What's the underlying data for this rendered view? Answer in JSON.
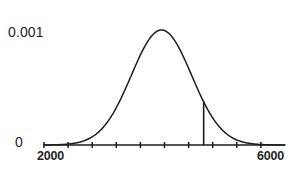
{
  "figure": {
    "title": "",
    "background_color": "#ffffff",
    "ink_color": "#1c1c1c",
    "label_color": "#242424"
  },
  "axes": {
    "y_axis": {
      "labels": [
        {
          "text": "0.001",
          "value": 0.001,
          "position": "top"
        },
        {
          "text": "0",
          "value": 0,
          "position": "bottom"
        }
      ],
      "line_drawn": false,
      "range": [
        0,
        0.001
      ]
    },
    "x_axis": {
      "labels": [
        {
          "text": "2000",
          "value": 2000,
          "position": "left"
        },
        {
          "text": "6000",
          "value": 6000,
          "position": "right"
        }
      ],
      "line_drawn": true,
      "range": [
        2000,
        6000
      ],
      "tick_count": 10,
      "tick_values": [
        2000,
        2400,
        2800,
        3200,
        3600,
        4000,
        4400,
        4800,
        5200,
        5600
      ]
    }
  },
  "annotations": {
    "vertical_marker": {
      "x_value": 4650,
      "description": "vertical line from axis up to the curve"
    }
  },
  "chart_data": {
    "type": "line",
    "title": "",
    "xlabel": "",
    "ylabel": "",
    "xlim": [
      2000,
      6000
    ],
    "ylim": [
      0,
      0.001
    ],
    "grid": false,
    "legend": false,
    "distribution": {
      "kind": "normal",
      "mean": 3950,
      "std_dev": 500,
      "peak_value": 0.00094
    },
    "series": [
      {
        "name": "normal density",
        "x": [
          2000,
          2150,
          2300,
          2450,
          2600,
          2750,
          2900,
          3050,
          3200,
          3350,
          3500,
          3650,
          3800,
          3950,
          4100,
          4250,
          4400,
          4550,
          4700,
          4850,
          5000,
          5150,
          5300,
          5450,
          5600,
          5750,
          5900,
          6000
        ],
        "values": [
          0.0,
          0.0,
          0.0,
          0.0,
          0.0,
          0.0001,
          0.0001,
          0.0002,
          0.0003,
          0.0005,
          0.0007,
          0.0009,
          0.0009,
          0.0009,
          0.0009,
          0.0008,
          0.0006,
          0.0004,
          0.0003,
          0.0001,
          0.0001,
          0.0,
          0.0,
          0.0,
          0.0,
          0.0,
          0.0,
          0.0
        ]
      }
    ],
    "markers": [
      {
        "type": "vline",
        "x": 4650,
        "y_from": 0,
        "y_to": 0.00042
      }
    ]
  }
}
